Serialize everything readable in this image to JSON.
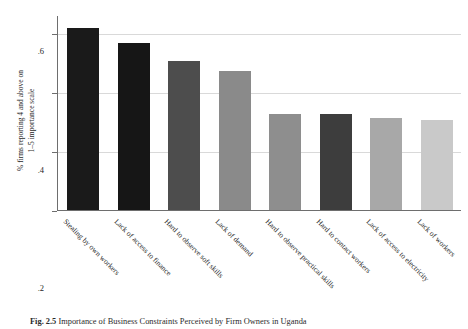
{
  "figure": {
    "caption_label": "Fig. 2.5",
    "caption_text": "Importance of Business Constraints Perceived by Firm Owners in Uganda"
  },
  "chart_data": {
    "type": "bar",
    "title": "",
    "subtitle": "",
    "xlabel": "",
    "ylabel_line1": "% firms reporting 4 and above on",
    "ylabel_line2": "1–5 importance scale",
    "ylim": [
      0,
      0.66
    ],
    "yticks": [
      0,
      0.2,
      0.4,
      0.6
    ],
    "ytick_labels": [
      "0",
      ".2",
      ".4",
      ".6"
    ],
    "grid": true,
    "legend": "none",
    "categories": [
      "Stealing by own workers",
      "Lack of access to finance",
      "Hard to observe soft skills",
      "Lack of demand",
      "Hard to observe practical skills",
      "Hard to contact workers",
      "Lack of access to electricity",
      "Lack of workers"
    ],
    "values": [
      0.615,
      0.565,
      0.505,
      0.47,
      0.325,
      0.325,
      0.31,
      0.305
    ],
    "bar_colors": [
      "#1a1a1a",
      "#161616",
      "#4d4d4d",
      "#8a8a8a",
      "#8e8e8e",
      "#3d3d3d",
      "#a8a8a8",
      "#c9c9c9"
    ]
  },
  "colors": {
    "axis": "#6e6e6e",
    "grid": "#d9d9d9",
    "background": "#ffffff",
    "text": "#1f1f1f"
  }
}
